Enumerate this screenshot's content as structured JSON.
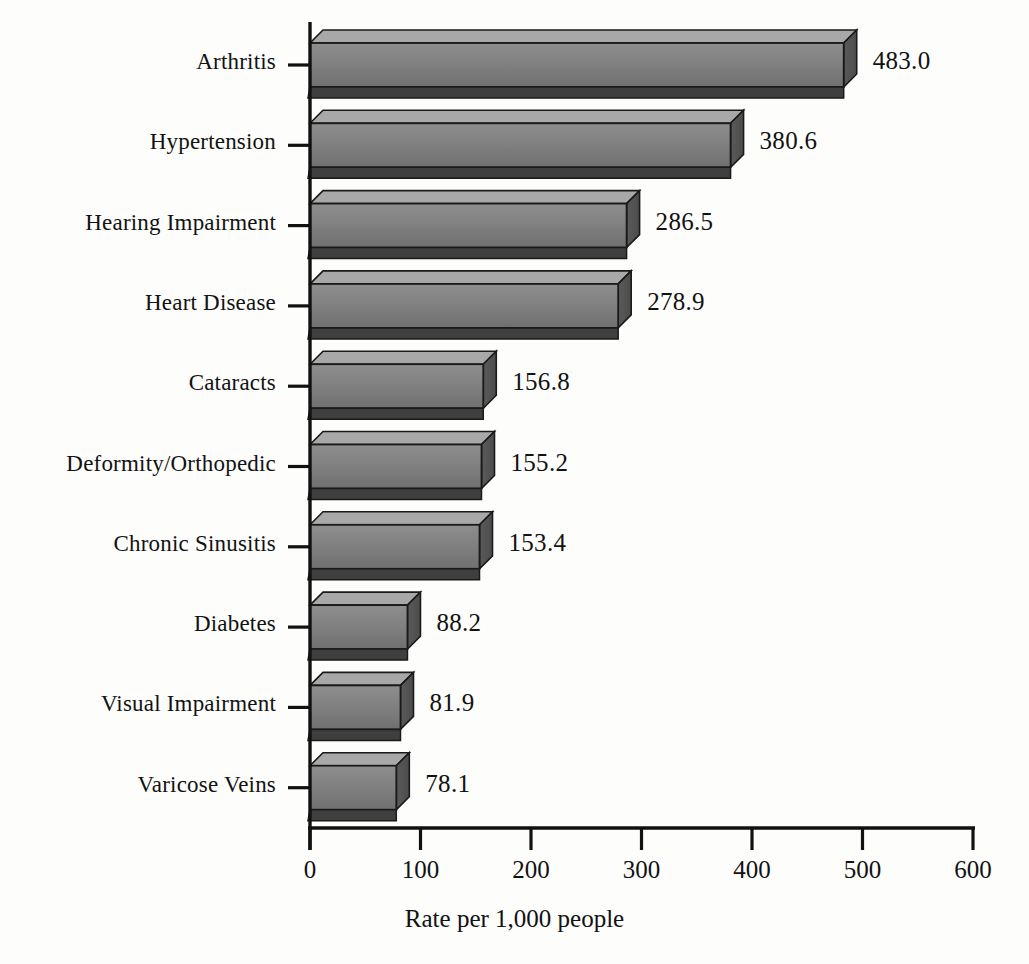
{
  "chart_data": {
    "type": "bar",
    "orientation": "horizontal",
    "title": "",
    "xlabel": "Rate per 1,000 people",
    "ylabel": "",
    "xlim": [
      0,
      600
    ],
    "xticks": [
      0,
      100,
      200,
      300,
      400,
      500,
      600
    ],
    "xtick_labels": [
      "0",
      "100",
      "200",
      "300",
      "400",
      "500",
      "600"
    ],
    "grid": false,
    "legend": null,
    "style": "3d-bars",
    "categories": [
      "Arthritis",
      "Hypertension",
      "Hearing Impairment",
      "Heart Disease",
      "Cataracts",
      "Deformity/Orthopedic",
      "Chronic Sinusitis",
      "Diabetes",
      "Visual Impairment",
      "Varicose Veins"
    ],
    "values": [
      483.0,
      380.6,
      286.5,
      278.9,
      156.8,
      155.2,
      153.4,
      88.2,
      81.9,
      78.1
    ],
    "value_labels": [
      "483.0",
      "380.6",
      "286.5",
      "278.9",
      "156.8",
      "155.2",
      "153.4",
      "88.2",
      "81.9",
      "78.1"
    ],
    "colors": {
      "bar_front_top": "#8e8e8e",
      "bar_front_bottom": "#707070",
      "bar_side": "#4c4c4c",
      "bar_bottom": "#3f3f3f",
      "bar_outline": "#1a1a1a",
      "axis": "#111111",
      "text": "#121212",
      "background": "#fdfdfc"
    }
  }
}
